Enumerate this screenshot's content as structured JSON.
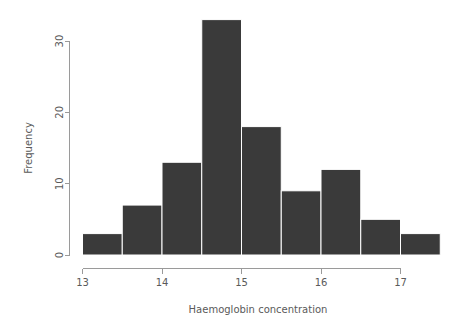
{
  "chart_data": {
    "type": "bar",
    "title": "",
    "subtitle": "",
    "xlabel": "Haemoglobin concentration",
    "ylabel": "Frequency",
    "bin_width": 0.5,
    "bin_edges": [
      13.0,
      13.5,
      14.0,
      14.5,
      15.0,
      15.5,
      16.0,
      16.5,
      17.0,
      17.5
    ],
    "categories": [
      "13.0-13.5",
      "13.5-14.0",
      "14.0-14.5",
      "14.5-15.0",
      "15.0-15.5",
      "15.5-16.0",
      "16.0-16.5",
      "16.5-17.0",
      "17.0-17.5"
    ],
    "bin_centers": [
      13.25,
      13.75,
      14.25,
      14.75,
      15.25,
      15.75,
      16.25,
      16.75,
      17.25
    ],
    "values": [
      3,
      7,
      13,
      33,
      18,
      9,
      12,
      5,
      3
    ],
    "xlim": [
      13.0,
      17.5
    ],
    "ylim": [
      0,
      33
    ],
    "xticks": [
      13,
      14,
      15,
      16,
      17
    ],
    "xtick_labels": [
      "13",
      "14",
      "15",
      "16",
      "17"
    ],
    "yticks": [
      0,
      10,
      20,
      30
    ],
    "ytick_labels": [
      "0",
      "10",
      "20",
      "30"
    ],
    "grid": false,
    "legend": false,
    "legend_position": "none",
    "bar_fill_color": "#3a3a3a",
    "bar_border_color": "#ffffff",
    "axis_color": "#9a9a9a",
    "text_color": "#5a5a5a",
    "background_color": "#ffffff"
  }
}
